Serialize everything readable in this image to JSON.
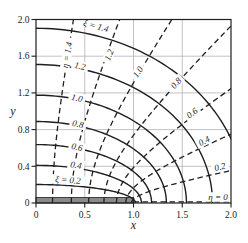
{
  "figure": {
    "width": 248,
    "height": 243,
    "colors": {
      "background": "#ffffff",
      "curve": "#1f1f1f",
      "grid": "#b2b2b2",
      "slit_fill": "#8a8a8a",
      "text": "#222222"
    }
  },
  "chart_data": {
    "type": "line",
    "xlabel": "x",
    "ylabel": "y",
    "xlim": [
      0,
      2
    ],
    "ylim": [
      0,
      2
    ],
    "x_tick_values": [
      0,
      0.5,
      1.0,
      1.5,
      2.0
    ],
    "x_tick_labels": [
      "0",
      "0.5",
      "1.0",
      "1.5",
      "2.0"
    ],
    "y_tick_values": [
      0,
      0.4,
      0.8,
      1.2,
      1.6,
      2.0
    ],
    "y_tick_labels": [
      "0",
      "0.4",
      "0.8",
      "1.2",
      "1.6",
      "2.0"
    ],
    "grid_x": [
      0.5,
      1.0,
      1.5
    ],
    "grid_y": [
      0.4,
      0.8,
      1.2,
      1.6
    ],
    "grid_on": true,
    "focal_distance_c": 1,
    "series": [
      {
        "name": "xi-ellipses",
        "style": "solid",
        "equation": "x = cosh(xi)cos(t), y = sinh(xi)sin(t)",
        "values": [
          0.2,
          0.4,
          0.6,
          0.8,
          1.0,
          1.2,
          1.4
        ]
      },
      {
        "name": "eta-hyperbolas",
        "style": "dashed",
        "equation": "x = cos(eta)cosh(s), y = sin(eta)sinh(s)",
        "values": [
          0.2,
          0.4,
          0.6,
          0.8,
          1.0,
          1.2,
          1.4
        ]
      },
      {
        "name": "eta-zero-ray",
        "style": "dashed",
        "values": [
          0
        ],
        "note": "dashed ray along y = 0 from x = 1 to x = 2"
      }
    ],
    "slit": {
      "from_x": 0,
      "to_x": 1,
      "y": 0
    },
    "curve_labels": [
      {
        "text": "ξ = 1.4",
        "family": "xi",
        "x": 96,
        "y": 26,
        "rot": 15
      },
      {
        "text": "1.2",
        "family": "xi",
        "x": 80,
        "y": 66,
        "rot": 11
      },
      {
        "text": "1.0",
        "family": "xi",
        "x": 77,
        "y": 98,
        "rot": 12
      },
      {
        "text": "0.8",
        "family": "xi",
        "x": 78,
        "y": 124,
        "rot": 12
      },
      {
        "text": "0.6",
        "family": "xi",
        "x": 77,
        "y": 147,
        "rot": 11
      },
      {
        "text": "0.4",
        "family": "xi",
        "x": 76,
        "y": 165,
        "rot": 8
      },
      {
        "text": "ξ = 0.2",
        "family": "xi",
        "x": 68,
        "y": 180,
        "rot": 4
      },
      {
        "text": "η = 1.4",
        "family": "eta",
        "x": 67,
        "y": 55,
        "rot": -80
      },
      {
        "text": "1.2",
        "family": "eta",
        "x": 109,
        "y": 55,
        "rot": -68
      },
      {
        "text": "1.0",
        "family": "eta",
        "x": 138,
        "y": 72,
        "rot": -56
      },
      {
        "text": "0.8",
        "family": "eta",
        "x": 176,
        "y": 83,
        "rot": -48
      },
      {
        "text": "0.6",
        "family": "eta",
        "x": 192,
        "y": 113,
        "rot": -37
      },
      {
        "text": "0.4",
        "family": "eta",
        "x": 204,
        "y": 141,
        "rot": -28
      },
      {
        "text": "0.2",
        "family": "eta",
        "x": 220,
        "y": 167,
        "rot": -15
      },
      {
        "text": "η = 0",
        "family": "eta",
        "x": 218,
        "y": 197,
        "rot": 0
      }
    ],
    "legend": null,
    "axes_box": true
  }
}
